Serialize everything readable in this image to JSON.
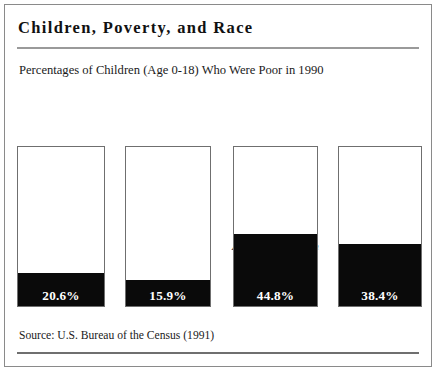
{
  "figure": {
    "title": "Children, Poverty, and Race",
    "subtitle": "Percentages of Children (Age 0-18) Who Were Poor in 1990",
    "source": "Source:  U.S. Bureau of the Census (1991)",
    "ink_color": "#0a0a0a",
    "frame_color": "#8a8a8a",
    "background_color": "#ffffff"
  },
  "chart_data": {
    "type": "bar",
    "title": "Children, Poverty, and Race",
    "subtitle": "Percentages of Children (Age 0-18) Who Were Poor in 1990",
    "xlabel": "",
    "ylabel": "",
    "ylim": [
      0,
      100
    ],
    "grid": false,
    "legend": "none",
    "orientation": "vertical",
    "value_suffix": "%",
    "categories": [
      "All Children",
      "White Children",
      "African-American Children",
      "Hispanic Children"
    ],
    "category_lines": [
      [
        "All Children"
      ],
      [
        "White Children"
      ],
      [
        "African-American",
        "Children"
      ],
      [
        "Hispanic",
        "Children"
      ]
    ],
    "values": [
      20.6,
      15.9,
      44.8,
      38.4
    ],
    "value_labels": [
      "20.6%",
      "15.9%",
      "44.8%",
      "38.4%"
    ],
    "bars": [
      {
        "category": "All Children",
        "value": 20.6,
        "label": "20.6%",
        "line1": "All Children",
        "line2": "",
        "left": 12,
        "width": 88,
        "fill_pct": 20.6
      },
      {
        "category": "White Children",
        "value": 15.9,
        "label": "15.9%",
        "line1": "White Children",
        "line2": "",
        "left": 120,
        "width": 86,
        "fill_pct": 15.9
      },
      {
        "category": "African-American Children",
        "value": 44.8,
        "label": "44.8%",
        "line1": "African-American",
        "line2": "Children",
        "left": 228,
        "width": 85,
        "fill_pct": 44.8
      },
      {
        "category": "Hispanic Children",
        "value": 38.4,
        "label": "38.4%",
        "line1": "Hispanic",
        "line2": "Children",
        "left": 333,
        "width": 84,
        "fill_pct": 38.4
      }
    ]
  }
}
